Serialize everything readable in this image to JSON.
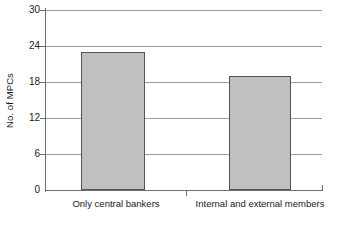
{
  "chart_data": {
    "type": "bar",
    "title": "",
    "xlabel": "",
    "ylabel": "No. of MPCs",
    "categories": [
      "Only central bankers",
      "Internal and external members"
    ],
    "values": [
      23,
      19
    ],
    "ylim": [
      0,
      30
    ],
    "yticks": [
      0,
      6,
      12,
      18,
      24,
      30
    ],
    "ytick_labels": [
      "0",
      "6",
      "12",
      "18",
      "24",
      "30"
    ],
    "grid": true,
    "legend": null,
    "series": [
      {
        "name": "No. of MPCs",
        "values": [
          23,
          19
        ],
        "color": "#c0c0c0",
        "border_color": "#555555"
      }
    ]
  },
  "axis": {
    "y_title": "No. of MPCs",
    "tick_0": "0",
    "tick_6": "6",
    "tick_12": "12",
    "tick_18": "18",
    "tick_24": "24",
    "tick_30": "30"
  },
  "labels": {
    "category_1": "Only central bankers",
    "category_2": "Internal and external members"
  },
  "caption": {
    "cutoff_text": ""
  },
  "colors": {
    "bar_fill": "#c0c0c0",
    "bar_border": "#555555",
    "gridline": "#9a9a9a",
    "axis_line": "#6e6e6e",
    "text": "#1a1a1a",
    "background": "#ffffff"
  }
}
